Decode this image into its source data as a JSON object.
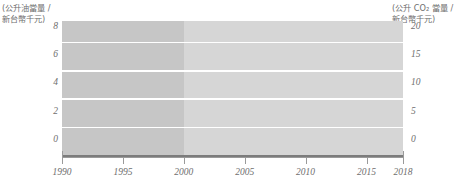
{
  "chart_data": {
    "type": "line",
    "title": "",
    "xlabel": "",
    "ylabel_left": "(公升油當量 /\n新台幣千元)",
    "ylabel_right": "(公升 CO₂ 當量 /\n新台幣千元)",
    "x": [
      1990,
      1991,
      1992,
      1993,
      1994,
      1995,
      1996,
      1997,
      1998,
      1999,
      2000,
      2001,
      2002,
      2003,
      2004,
      2005,
      2006,
      2007,
      2008,
      2009,
      2010,
      2011,
      2012,
      2013,
      2014,
      2015,
      2016,
      2017,
      2018
    ],
    "xlim": [
      1990,
      2018
    ],
    "xticks": [
      1990,
      1995,
      2000,
      2005,
      2010,
      2015,
      2018
    ],
    "xticklabels": [
      "1990",
      "1995",
      "2000",
      "2005",
      "2010",
      "2015",
      "2018"
    ],
    "ylim_left": [
      0,
      9.6
    ],
    "yticks_left": [
      0,
      2,
      4,
      6,
      8
    ],
    "yticklabels_left": [
      "0",
      "2",
      "4",
      "6",
      "8"
    ],
    "ylim_right": [
      0,
      24
    ],
    "yticks_right": [
      0,
      5,
      10,
      15,
      20
    ],
    "yticklabels_right": [
      "0",
      "5",
      "10",
      "15",
      "20"
    ],
    "grid": true,
    "legend": "none",
    "shaded_split_year": 2000,
    "series": [
      {
        "name": "co2-intensity",
        "axis": "right",
        "color": "#808080",
        "values_right": [
          22.8,
          22.7,
          22.6,
          22.5,
          22.4,
          22.4,
          22.5,
          22.4,
          22.3,
          22.2,
          22.5,
          23.0,
          22.8,
          23.1,
          23.1,
          22.6,
          21.9,
          21.2,
          20.5,
          19.8,
          19.4,
          19.0,
          18.7,
          18.4,
          18.1,
          17.8,
          17.5,
          17.2,
          16.9
        ]
      },
      {
        "name": "energy-intensity",
        "axis": "left",
        "color": "#161616",
        "values_left": [
          7.95,
          7.9,
          7.85,
          7.8,
          7.75,
          7.7,
          7.65,
          7.58,
          7.5,
          7.35,
          6.85,
          7.15,
          7.25,
          7.25,
          7.25,
          7.2,
          7.05,
          6.85,
          6.65,
          6.5,
          6.5,
          6.4,
          6.3,
          6.2,
          6.1,
          5.9,
          5.7,
          5.5,
          5.35
        ]
      }
    ]
  }
}
